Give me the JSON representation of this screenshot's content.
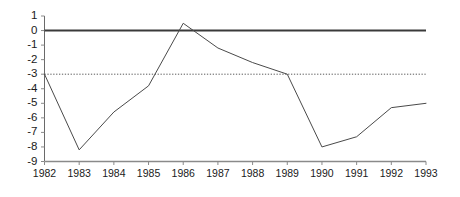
{
  "chart_data": {
    "type": "line",
    "title": "",
    "subtitle": "",
    "xlabel": "",
    "ylabel": "",
    "x": [
      1982,
      1983,
      1984,
      1985,
      1986,
      1987,
      1988,
      1989,
      1990,
      1991,
      1992,
      1993
    ],
    "xticklabels": [
      "1982",
      "1983",
      "1984",
      "1985",
      "1986",
      "1987",
      "1988",
      "1989",
      "1990",
      "1991",
      "1992",
      "1993"
    ],
    "yticks": [
      1,
      0,
      -1,
      -2,
      -3,
      -4,
      -5,
      -6,
      -7,
      -8,
      -9
    ],
    "yticklabels": [
      "1",
      "0",
      "-1",
      "-2",
      "-3",
      "-4",
      "-5",
      "-6",
      "-7",
      "-8",
      "-9"
    ],
    "ylim": [
      -9,
      1
    ],
    "xlim": [
      1982,
      1993
    ],
    "grid": false,
    "legend": null,
    "series": [
      {
        "name": "series-1",
        "values": [
          -3.0,
          -8.2,
          -5.6,
          -3.8,
          0.5,
          -1.2,
          -2.2,
          -3.0,
          -8.0,
          -7.3,
          -5.3,
          -5.0
        ],
        "color": "#4a4a4a",
        "style": "solid",
        "width": 1
      }
    ],
    "reference_lines": [
      {
        "name": "zero-line",
        "value": 0,
        "orientation": "horizontal",
        "style": "solid",
        "color": "#3a3a3a",
        "width": 2
      },
      {
        "name": "threshold-line",
        "value": -3,
        "orientation": "horizontal",
        "style": "dotted",
        "color": "#5a5a5a",
        "width": 1
      }
    ],
    "axes": {
      "left_axis_color": "#6a6a6a",
      "bottom_axis_color": "#8a8a8a",
      "tick_color": "#8a8a8a"
    }
  }
}
